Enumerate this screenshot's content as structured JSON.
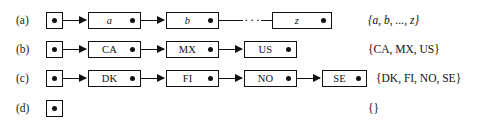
{
  "figure": {
    "kind": "linked-list-diagram",
    "ink_color": "#111111",
    "background_color": "#ffffff",
    "rows": [
      {
        "label": "(a)",
        "italic_labels": true,
        "head": {
          "name": "head-pointer"
        },
        "nodes": [
          {
            "label": "a"
          },
          {
            "label": "b"
          },
          {
            "label": "z"
          }
        ],
        "ellipsis": "···",
        "set_text": "{a, b, ..., z}"
      },
      {
        "label": "(b)",
        "italic_labels": false,
        "head": {
          "name": "head-pointer"
        },
        "nodes": [
          {
            "label": "CA"
          },
          {
            "label": "MX"
          },
          {
            "label": "US"
          }
        ],
        "set_text": "{CA, MX, US}"
      },
      {
        "label": "(c)",
        "italic_labels": false,
        "head": {
          "name": "head-pointer"
        },
        "nodes": [
          {
            "label": "DK"
          },
          {
            "label": "FI"
          },
          {
            "label": "NO"
          },
          {
            "label": "SE"
          }
        ],
        "set_text": "{DK, FI, NO, SE}"
      },
      {
        "label": "(d)",
        "italic_labels": false,
        "head": {
          "name": "head-pointer"
        },
        "nodes": [],
        "set_text": "{}"
      }
    ]
  }
}
